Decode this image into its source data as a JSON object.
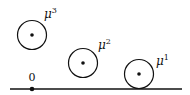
{
  "diagram": {
    "baseline": {
      "x1": 10,
      "x2": 182,
      "y": 89,
      "color": "#111111"
    },
    "origin": {
      "label": "0",
      "x": 32,
      "y": 89
    },
    "measures": [
      {
        "id": "mu1",
        "symbol": "μ",
        "superscript": "1",
        "cx": 139,
        "cy": 74,
        "r": 15,
        "label_x": 155,
        "label_y": 65
      },
      {
        "id": "mu2",
        "symbol": "μ",
        "superscript": "2",
        "cx": 83,
        "cy": 63,
        "r": 15,
        "label_x": 98,
        "label_y": 49
      },
      {
        "id": "mu3",
        "symbol": "μ",
        "superscript": "3",
        "cx": 32,
        "cy": 35,
        "r": 15,
        "label_x": 44,
        "label_y": 18
      }
    ]
  }
}
